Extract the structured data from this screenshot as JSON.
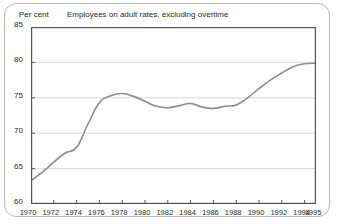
{
  "chart": {
    "unit_label": "Per cent",
    "title": "Employees on adult rates, excluding overtime"
  },
  "chart_data": {
    "type": "line",
    "title": "Employees on adult rates, excluding overtime",
    "subtitle": "",
    "xlabel": "",
    "ylabel": "Per cent",
    "ylim": [
      60,
      85
    ],
    "xlim": [
      1970,
      1995
    ],
    "ytick_labels": [
      "60",
      "65",
      "70",
      "75",
      "80",
      "85"
    ],
    "ytick_values": [
      60,
      65,
      70,
      75,
      80,
      85
    ],
    "xtick_labels": [
      "1970",
      "1972",
      "1974",
      "1976",
      "1978",
      "1980",
      "1982",
      "1984",
      "1986",
      "1988",
      "1990",
      "1992",
      "1994",
      "1995"
    ],
    "xtick_values": [
      1970,
      1972,
      1974,
      1976,
      1978,
      1980,
      1982,
      1984,
      1986,
      1988,
      1990,
      1992,
      1994,
      1995
    ],
    "grid": true,
    "grid_axis": "y",
    "legend": false,
    "legend_position": "none",
    "line_color": "#8c8c8c",
    "x": [
      1970,
      1971,
      1972,
      1973,
      1974,
      1975,
      1976,
      1977,
      1978,
      1979,
      1980,
      1981,
      1982,
      1983,
      1984,
      1985,
      1986,
      1987,
      1988,
      1989,
      1990,
      1991,
      1992,
      1993,
      1994,
      1995
    ],
    "values": [
      63.3,
      64.5,
      65.9,
      67.2,
      68.0,
      71.3,
      74.3,
      75.3,
      75.6,
      75.2,
      74.5,
      73.8,
      73.6,
      73.9,
      74.2,
      73.7,
      73.5,
      73.8,
      74.0,
      75.0,
      76.3,
      77.5,
      78.5,
      79.4,
      79.8,
      79.9
    ],
    "series": [
      {
        "name": "Employees on adult rates, excluding overtime",
        "values": [
          63.3,
          64.5,
          65.9,
          67.2,
          68.0,
          71.3,
          74.3,
          75.3,
          75.6,
          75.2,
          74.5,
          73.8,
          73.6,
          73.9,
          74.2,
          73.7,
          73.5,
          73.8,
          74.0,
          75.0,
          76.3,
          77.5,
          78.5,
          79.4,
          79.8,
          79.9
        ]
      }
    ]
  }
}
